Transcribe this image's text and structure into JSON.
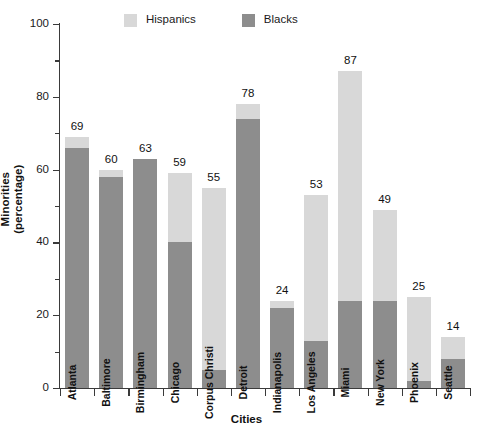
{
  "chart_data": {
    "type": "bar",
    "subtype": "stacked-vertical",
    "title": "",
    "xlabel": "Cities",
    "ylabel": "Minorities (percentage)",
    "ylim": [
      0,
      100
    ],
    "ytick_labels": [
      "0",
      "20",
      "40",
      "60",
      "80",
      "100"
    ],
    "ytick_values": [
      0,
      20,
      40,
      60,
      80,
      100
    ],
    "yminor_values": [
      10,
      30,
      50,
      70,
      90
    ],
    "grid": false,
    "legend_position": "top-center",
    "categories": [
      "Atlanta",
      "Baltimore",
      "Birmingham",
      "Chicago",
      "Corpus Christi",
      "Detroit",
      "Indianapolis",
      "Los Angeles",
      "Miami",
      "New York",
      "Phoenix",
      "Seattle"
    ],
    "series": [
      {
        "name": "Blacks",
        "color": "#8d8d8d",
        "values": [
          66,
          58,
          63,
          40,
          5,
          74,
          22,
          13,
          24,
          24,
          2,
          8
        ]
      },
      {
        "name": "Hispanics",
        "color": "#d8d8d8",
        "values": [
          3,
          2,
          0,
          19,
          50,
          4,
          2,
          40,
          63,
          25,
          23,
          6
        ]
      }
    ],
    "totals": [
      69,
      60,
      63,
      59,
      55,
      78,
      24,
      53,
      87,
      49,
      25,
      14
    ],
    "total_labels": [
      "69",
      "60",
      "63",
      "59",
      "55",
      "78",
      "24",
      "53",
      "87",
      "49",
      "25",
      "14"
    ]
  },
  "legend": {
    "entries": [
      {
        "label": "Hispanics",
        "color": "#d8d8d8"
      },
      {
        "label": "Blacks",
        "color": "#8d8d8d"
      }
    ]
  },
  "axes": {
    "x_title": "Cities",
    "y_title_line1": "Minorities",
    "y_title_line2": "(percentage)"
  },
  "colors": {
    "hispanics": "#d8d8d8",
    "blacks": "#8d8d8d",
    "axis": "#3a3a3a",
    "text": "#1a1a1a",
    "background": "#ffffff"
  }
}
